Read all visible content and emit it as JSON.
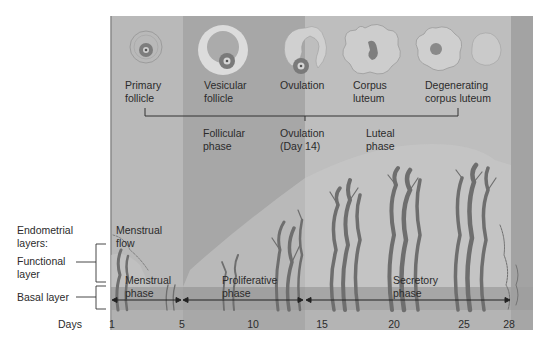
{
  "diagram": {
    "colors": {
      "menstrual_bg": "#b8b8b8",
      "follicular_bg": "#a6a6a6",
      "luteal_bg": "#bdbdbd",
      "right_edge_bg": "#a3a3a3",
      "basal_band": "#9a9a9a",
      "vessel": "#6f6f6f",
      "functional_layer": "#c4c4c4",
      "line": "#333333"
    },
    "ovarian_stages": [
      {
        "label_line1": "Primary",
        "label_line2": "follicle"
      },
      {
        "label_line1": "Vesicular",
        "label_line2": "follicle"
      },
      {
        "label_line1": "Ovulation",
        "label_line2": ""
      },
      {
        "label_line1": "Corpus",
        "label_line2": "luteum"
      },
      {
        "label_line1": "Degenerating",
        "label_line2": "corpus luteum"
      }
    ],
    "ovarian_phases": [
      {
        "line1": "Follicular",
        "line2": "phase"
      },
      {
        "line1": "Ovulation",
        "line2": "(Day 14)"
      },
      {
        "line1": "Luteal",
        "line2": "phase"
      }
    ],
    "left_labels": {
      "endometrial_line1": "Endometrial",
      "endometrial_line2": "layers:",
      "functional_line1": "Functional",
      "functional_line2": "layer",
      "basal": "Basal layer"
    },
    "uterine_labels": {
      "menstrual_flow_line1": "Menstrual",
      "menstrual_flow_line2": "flow"
    },
    "uterine_phases": [
      {
        "line1": "Menstrual",
        "line2": "phase"
      },
      {
        "line1": "Proliferative",
        "line2": "phase"
      },
      {
        "line1": "Secretory",
        "line2": "phase"
      }
    ],
    "days_axis": {
      "label": "Days",
      "ticks": [
        "1",
        "5",
        "10",
        "15",
        "20",
        "25",
        "28"
      ]
    }
  }
}
